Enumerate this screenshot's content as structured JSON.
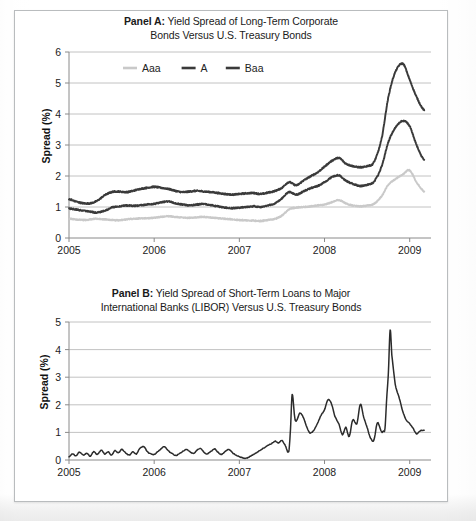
{
  "figure": {
    "background_color": "#ffffff",
    "frame_border_color": "#b9bcbe"
  },
  "panel_a": {
    "title_lead": "Panel A:",
    "title_rest": " Yield Spread of Long-Term Corporate",
    "title_line2": "Bonds Versus U.S. Treasury Bonds",
    "ylabel": "Spread (%)",
    "yticks": [
      "0",
      "1",
      "2",
      "3",
      "4",
      "5",
      "6"
    ],
    "xticks": [
      "2005",
      "2006",
      "2007",
      "2008",
      "2009"
    ],
    "legend": [
      {
        "label": "Aaa",
        "color": "#c9c9c9"
      },
      {
        "label": "A",
        "color": "#3a3a3a"
      },
      {
        "label": "Baa",
        "color": "#3a3a3a"
      }
    ]
  },
  "panel_b": {
    "title_lead": "Panel B:",
    "title_rest": " Yield Spread of Short-Term Loans to Major",
    "title_line2": "International Banks (LIBOR) Versus U.S. Treasury Bonds",
    "ylabel": "Spread (%)",
    "yticks": [
      "0",
      "1",
      "2",
      "3",
      "4",
      "5"
    ],
    "xticks": [
      "2005",
      "2006",
      "2007",
      "2008",
      "2009"
    ],
    "series_color": "#2b2b2b"
  },
  "chart_data": [
    {
      "type": "line",
      "panel": "A",
      "title": "Panel A: Yield Spread of Long-Term Corporate Bonds Versus U.S. Treasury Bonds",
      "xlabel": "",
      "ylabel": "Spread (%)",
      "xlim": [
        2005.0,
        2009.25
      ],
      "ylim": [
        0,
        6
      ],
      "yticks": [
        0,
        1,
        2,
        3,
        4,
        5,
        6
      ],
      "xticks": [
        2005,
        2006,
        2007,
        2008,
        2009
      ],
      "grid": true,
      "legend_position": "top-center",
      "series": [
        {
          "name": "Aaa",
          "color": "#c9c9c9",
          "x": [
            2005.0,
            2005.08,
            2005.17,
            2005.25,
            2005.33,
            2005.42,
            2005.5,
            2005.58,
            2005.67,
            2005.75,
            2005.83,
            2005.92,
            2006.0,
            2006.08,
            2006.17,
            2006.25,
            2006.33,
            2006.42,
            2006.5,
            2006.58,
            2006.67,
            2006.75,
            2006.83,
            2006.92,
            2007.0,
            2007.08,
            2007.17,
            2007.25,
            2007.33,
            2007.42,
            2007.5,
            2007.58,
            2007.67,
            2007.75,
            2007.83,
            2007.92,
            2008.0,
            2008.08,
            2008.17,
            2008.25,
            2008.33,
            2008.42,
            2008.5,
            2008.58,
            2008.67,
            2008.75,
            2008.83,
            2008.92,
            2009.0,
            2009.08,
            2009.17
          ],
          "values": [
            0.62,
            0.6,
            0.58,
            0.6,
            0.62,
            0.6,
            0.58,
            0.57,
            0.6,
            0.62,
            0.63,
            0.64,
            0.65,
            0.68,
            0.7,
            0.68,
            0.66,
            0.65,
            0.67,
            0.68,
            0.66,
            0.64,
            0.62,
            0.6,
            0.58,
            0.57,
            0.56,
            0.55,
            0.58,
            0.62,
            0.72,
            0.92,
            0.98,
            1.0,
            1.02,
            1.05,
            1.08,
            1.15,
            1.22,
            1.12,
            1.05,
            1.02,
            1.05,
            1.1,
            1.35,
            1.72,
            1.9,
            2.05,
            2.18,
            1.8,
            1.5
          ]
        },
        {
          "name": "A",
          "color": "#3a3a3a",
          "x": [
            2005.0,
            2005.08,
            2005.17,
            2005.25,
            2005.33,
            2005.42,
            2005.5,
            2005.58,
            2005.67,
            2005.75,
            2005.83,
            2005.92,
            2006.0,
            2006.08,
            2006.17,
            2006.25,
            2006.33,
            2006.42,
            2006.5,
            2006.58,
            2006.67,
            2006.75,
            2006.83,
            2006.92,
            2007.0,
            2007.08,
            2007.17,
            2007.25,
            2007.33,
            2007.42,
            2007.5,
            2007.58,
            2007.67,
            2007.75,
            2007.83,
            2007.92,
            2008.0,
            2008.08,
            2008.17,
            2008.25,
            2008.33,
            2008.42,
            2008.5,
            2008.58,
            2008.67,
            2008.75,
            2008.83,
            2008.92,
            2009.0,
            2009.08,
            2009.17
          ],
          "values": [
            0.95,
            0.92,
            0.88,
            0.85,
            0.82,
            0.88,
            0.98,
            1.02,
            1.05,
            1.04,
            1.05,
            1.08,
            1.1,
            1.15,
            1.18,
            1.12,
            1.08,
            1.05,
            1.08,
            1.1,
            1.06,
            1.02,
            0.98,
            0.96,
            0.98,
            1.0,
            1.02,
            1.0,
            1.05,
            1.12,
            1.28,
            1.48,
            1.4,
            1.5,
            1.6,
            1.68,
            1.8,
            1.95,
            2.02,
            1.85,
            1.75,
            1.68,
            1.72,
            1.82,
            2.3,
            3.1,
            3.55,
            3.78,
            3.6,
            3.0,
            2.52
          ]
        },
        {
          "name": "Baa",
          "color": "#3a3a3a",
          "x": [
            2005.0,
            2005.08,
            2005.17,
            2005.25,
            2005.33,
            2005.42,
            2005.5,
            2005.58,
            2005.67,
            2005.75,
            2005.83,
            2005.92,
            2006.0,
            2006.08,
            2006.17,
            2006.25,
            2006.33,
            2006.42,
            2006.5,
            2006.58,
            2006.67,
            2006.75,
            2006.83,
            2006.92,
            2007.0,
            2007.08,
            2007.17,
            2007.25,
            2007.33,
            2007.42,
            2007.5,
            2007.58,
            2007.67,
            2007.75,
            2007.83,
            2007.92,
            2008.0,
            2008.08,
            2008.17,
            2008.25,
            2008.33,
            2008.42,
            2008.5,
            2008.58,
            2008.67,
            2008.75,
            2008.83,
            2008.92,
            2009.0,
            2009.08,
            2009.17
          ],
          "values": [
            1.25,
            1.18,
            1.12,
            1.12,
            1.2,
            1.38,
            1.48,
            1.5,
            1.48,
            1.52,
            1.58,
            1.62,
            1.65,
            1.62,
            1.58,
            1.52,
            1.48,
            1.5,
            1.52,
            1.5,
            1.48,
            1.45,
            1.42,
            1.4,
            1.42,
            1.44,
            1.45,
            1.42,
            1.46,
            1.52,
            1.62,
            1.8,
            1.7,
            1.85,
            1.98,
            2.12,
            2.3,
            2.48,
            2.58,
            2.4,
            2.32,
            2.28,
            2.32,
            2.45,
            3.2,
            4.55,
            5.35,
            5.62,
            5.1,
            4.55,
            4.12
          ]
        }
      ]
    },
    {
      "type": "line",
      "panel": "B",
      "title": "Panel B: Yield Spread of Short-Term Loans to Major International Banks (LIBOR) Versus U.S. Treasury Bonds",
      "xlabel": "",
      "ylabel": "Spread (%)",
      "xlim": [
        2005.0,
        2009.25
      ],
      "ylim": [
        0,
        5
      ],
      "yticks": [
        0,
        1,
        2,
        3,
        4,
        5
      ],
      "xticks": [
        2005,
        2006,
        2007,
        2008,
        2009
      ],
      "grid": true,
      "legend_position": "none",
      "series": [
        {
          "name": "LIBOR spread",
          "color": "#2b2b2b",
          "x": [
            2005.0,
            2005.04,
            2005.08,
            2005.12,
            2005.17,
            2005.21,
            2005.25,
            2005.29,
            2005.33,
            2005.38,
            2005.42,
            2005.46,
            2005.5,
            2005.54,
            2005.58,
            2005.62,
            2005.67,
            2005.71,
            2005.75,
            2005.79,
            2005.83,
            2005.88,
            2005.92,
            2005.96,
            2006.0,
            2006.04,
            2006.08,
            2006.12,
            2006.17,
            2006.21,
            2006.25,
            2006.29,
            2006.33,
            2006.38,
            2006.42,
            2006.46,
            2006.5,
            2006.54,
            2006.58,
            2006.62,
            2006.67,
            2006.71,
            2006.75,
            2006.79,
            2006.83,
            2006.88,
            2006.92,
            2006.96,
            2007.0,
            2007.04,
            2007.08,
            2007.12,
            2007.17,
            2007.21,
            2007.25,
            2007.29,
            2007.33,
            2007.38,
            2007.42,
            2007.46,
            2007.5,
            2007.54,
            2007.58,
            2007.6,
            2007.62,
            2007.65,
            2007.67,
            2007.71,
            2007.75,
            2007.79,
            2007.83,
            2007.88,
            2007.92,
            2007.96,
            2008.0,
            2008.04,
            2008.08,
            2008.12,
            2008.17,
            2008.21,
            2008.25,
            2008.29,
            2008.33,
            2008.38,
            2008.42,
            2008.46,
            2008.5,
            2008.54,
            2008.58,
            2008.62,
            2008.67,
            2008.69,
            2008.71,
            2008.73,
            2008.75,
            2008.77,
            2008.79,
            2008.83,
            2008.88,
            2008.92,
            2008.96,
            2009.0,
            2009.04,
            2009.08,
            2009.12,
            2009.17
          ],
          "values": [
            0.12,
            0.22,
            0.15,
            0.28,
            0.18,
            0.25,
            0.14,
            0.3,
            0.2,
            0.35,
            0.22,
            0.3,
            0.18,
            0.34,
            0.26,
            0.38,
            0.24,
            0.18,
            0.3,
            0.22,
            0.42,
            0.48,
            0.3,
            0.22,
            0.2,
            0.3,
            0.4,
            0.48,
            0.32,
            0.24,
            0.16,
            0.22,
            0.3,
            0.38,
            0.3,
            0.24,
            0.34,
            0.42,
            0.3,
            0.22,
            0.32,
            0.4,
            0.28,
            0.2,
            0.3,
            0.38,
            0.26,
            0.18,
            0.12,
            0.08,
            0.06,
            0.12,
            0.2,
            0.28,
            0.36,
            0.44,
            0.52,
            0.6,
            0.68,
            0.62,
            0.7,
            0.52,
            0.3,
            1.1,
            2.38,
            1.55,
            1.42,
            1.7,
            1.55,
            1.2,
            0.98,
            1.1,
            1.35,
            1.62,
            1.82,
            2.18,
            2.05,
            1.6,
            1.3,
            0.92,
            1.18,
            0.85,
            1.45,
            1.32,
            2.02,
            1.55,
            1.18,
            0.8,
            0.72,
            1.35,
            1.02,
            1.05,
            1.15,
            2.25,
            3.18,
            4.7,
            3.8,
            2.75,
            2.22,
            1.75,
            1.45,
            1.32,
            1.15,
            0.95,
            1.05,
            1.08
          ]
        }
      ]
    }
  ]
}
